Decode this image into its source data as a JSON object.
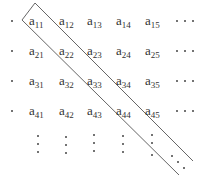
{
  "matrix": {
    "base": "a",
    "rows": [
      [
        "11",
        "12",
        "13",
        "14",
        "15"
      ],
      [
        "21",
        "22",
        "23",
        "24",
        "25"
      ],
      [
        "31",
        "32",
        "33",
        "34",
        "35"
      ],
      [
        "41",
        "42",
        "43",
        "44",
        "45"
      ]
    ],
    "row_continuation": "...",
    "column_continuation": "vertical-ellipsis",
    "diagonal_continuation": "diagonal-ellipsis",
    "highlighted_band": "main-diagonal",
    "highlighted_entries": [
      "a11",
      "a22",
      "a33",
      "a44"
    ]
  },
  "colors": {
    "text": "#333333",
    "band_stroke": "#555555",
    "dots": "#444444"
  }
}
